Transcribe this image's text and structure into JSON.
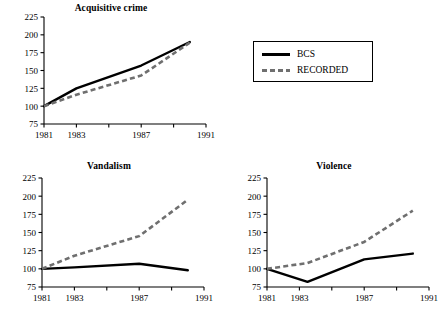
{
  "figure": {
    "legend": {
      "entries": [
        {
          "label": "BCS",
          "style": "solid",
          "color": "#000000"
        },
        {
          "label": "RECORDED",
          "style": "dashed",
          "color": "#6f6f6f"
        }
      ]
    }
  },
  "chart_data": [
    {
      "type": "line",
      "title": "Acquisitive crime",
      "xlabel": "",
      "ylabel": "",
      "xlim": [
        1981,
        1991
      ],
      "ylim": [
        75,
        225
      ],
      "yticks": [
        75,
        100,
        125,
        150,
        175,
        200,
        225
      ],
      "ytick_labels": [
        "75",
        "100",
        "125",
        "150",
        "175",
        "200",
        "225"
      ],
      "xticks": [
        1981,
        1983,
        1985,
        1987,
        1989,
        1991
      ],
      "xtick_labels": [
        "1981",
        "1983",
        "",
        "1987",
        "",
        "1991"
      ],
      "grid": false,
      "legend_position": "external-top-right",
      "series": [
        {
          "name": "BCS",
          "style": "solid",
          "x": [
            1981,
            1983,
            1987,
            1990
          ],
          "values": [
            100,
            125,
            157,
            190
          ]
        },
        {
          "name": "RECORDED",
          "style": "dashed",
          "x": [
            1981,
            1983,
            1987,
            1990
          ],
          "values": [
            100,
            116,
            143,
            189
          ]
        }
      ]
    },
    {
      "type": "line",
      "title": "Vandalism",
      "xlabel": "",
      "ylabel": "",
      "xlim": [
        1981,
        1991
      ],
      "ylim": [
        75,
        225
      ],
      "yticks": [
        75,
        100,
        125,
        150,
        175,
        200,
        225
      ],
      "ytick_labels": [
        "75",
        "100",
        "125",
        "150",
        "175",
        "200",
        "225"
      ],
      "xticks": [
        1981,
        1983,
        1985,
        1987,
        1989,
        1991
      ],
      "xtick_labels": [
        "1981",
        "1983",
        "",
        "1987",
        "",
        "1991"
      ],
      "grid": false,
      "legend_position": "none",
      "series": [
        {
          "name": "BCS",
          "style": "solid",
          "x": [
            1981,
            1983,
            1987,
            1990
          ],
          "values": [
            100,
            102,
            107,
            98
          ]
        },
        {
          "name": "RECORDED",
          "style": "dashed",
          "x": [
            1981,
            1983,
            1987,
            1990
          ],
          "values": [
            100,
            118,
            145,
            195
          ]
        }
      ]
    },
    {
      "type": "line",
      "title": "Violence",
      "xlabel": "",
      "ylabel": "",
      "xlim": [
        1981,
        1991
      ],
      "ylim": [
        75,
        225
      ],
      "yticks": [
        75,
        100,
        125,
        150,
        175,
        200,
        225
      ],
      "ytick_labels": [
        "75",
        "100",
        "125",
        "150",
        "175",
        "200",
        "225"
      ],
      "xticks": [
        1981,
        1983,
        1985,
        1987,
        1989,
        1991
      ],
      "xtick_labels": [
        "1981",
        "1983",
        "",
        "1987",
        "",
        "1991"
      ],
      "grid": false,
      "legend_position": "none",
      "series": [
        {
          "name": "BCS",
          "style": "solid",
          "x": [
            1981,
            1983.5,
            1987,
            1990
          ],
          "values": [
            100,
            82,
            113,
            121
          ]
        },
        {
          "name": "RECORDED",
          "style": "dashed",
          "x": [
            1981,
            1983.5,
            1987,
            1990
          ],
          "values": [
            100,
            108,
            137,
            180
          ]
        }
      ]
    }
  ]
}
